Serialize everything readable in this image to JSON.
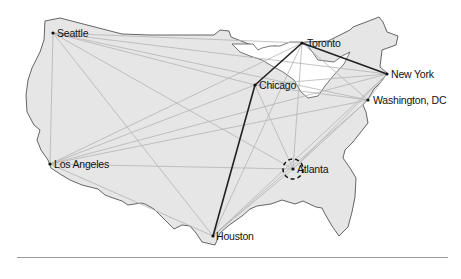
{
  "figure": {
    "type": "network-map",
    "region": "United States",
    "highlighted_city": "Atlanta",
    "colors": {
      "land_fill": "#e6e6e6",
      "land_stroke": "#555555",
      "lakes_fill": "#ffffff",
      "light_links": "#b4b4b4",
      "bold_route": "#222222",
      "divider": "#9a9a9a"
    }
  },
  "cities": [
    {
      "id": "seattle",
      "label": "Seattle",
      "x": 53,
      "y": 33
    },
    {
      "id": "toronto",
      "label": "Toronto",
      "x": 302,
      "y": 43
    },
    {
      "id": "chicago",
      "label": "Chicago",
      "x": 255,
      "y": 85
    },
    {
      "id": "newyork",
      "label": "New York",
      "x": 387,
      "y": 74
    },
    {
      "id": "washington",
      "label": "Washington, DC",
      "x": 368,
      "y": 100
    },
    {
      "id": "losangeles",
      "label": "Los Angeles",
      "x": 50,
      "y": 164
    },
    {
      "id": "atlanta",
      "label": "Atlanta",
      "x": 293,
      "y": 169
    },
    {
      "id": "houston",
      "label": "Houston",
      "x": 213,
      "y": 236
    }
  ],
  "bold_route": [
    "houston",
    "chicago",
    "toronto",
    "newyork"
  ]
}
